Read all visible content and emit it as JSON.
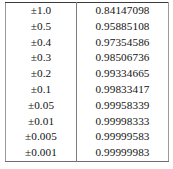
{
  "table": {
    "name": "tolerance-value-table",
    "row_count": 10,
    "column_count": 2,
    "has_header": false,
    "text_color": "#131313",
    "border_color": "#7d7d7d",
    "background_color": "#ffffff",
    "columns": [
      {
        "key": "tolerance",
        "align": "center"
      },
      {
        "key": "value",
        "align": "center"
      }
    ],
    "rows": [
      {
        "tolerance": "±1.0",
        "value": "0.84147098"
      },
      {
        "tolerance": "±0.5",
        "value": "0.95885108"
      },
      {
        "tolerance": "±0.4",
        "value": "0.97354586"
      },
      {
        "tolerance": "±0.3",
        "value": "0.98506736"
      },
      {
        "tolerance": "±0.2",
        "value": "0.99334665"
      },
      {
        "tolerance": "±0.1",
        "value": "0.99833417"
      },
      {
        "tolerance": "±0.05",
        "value": "0.99958339"
      },
      {
        "tolerance": "±0.01",
        "value": "0.99998333"
      },
      {
        "tolerance": "±0.005",
        "value": "0.99999583"
      },
      {
        "tolerance": "±0.001",
        "value": "0.99999983"
      }
    ]
  }
}
